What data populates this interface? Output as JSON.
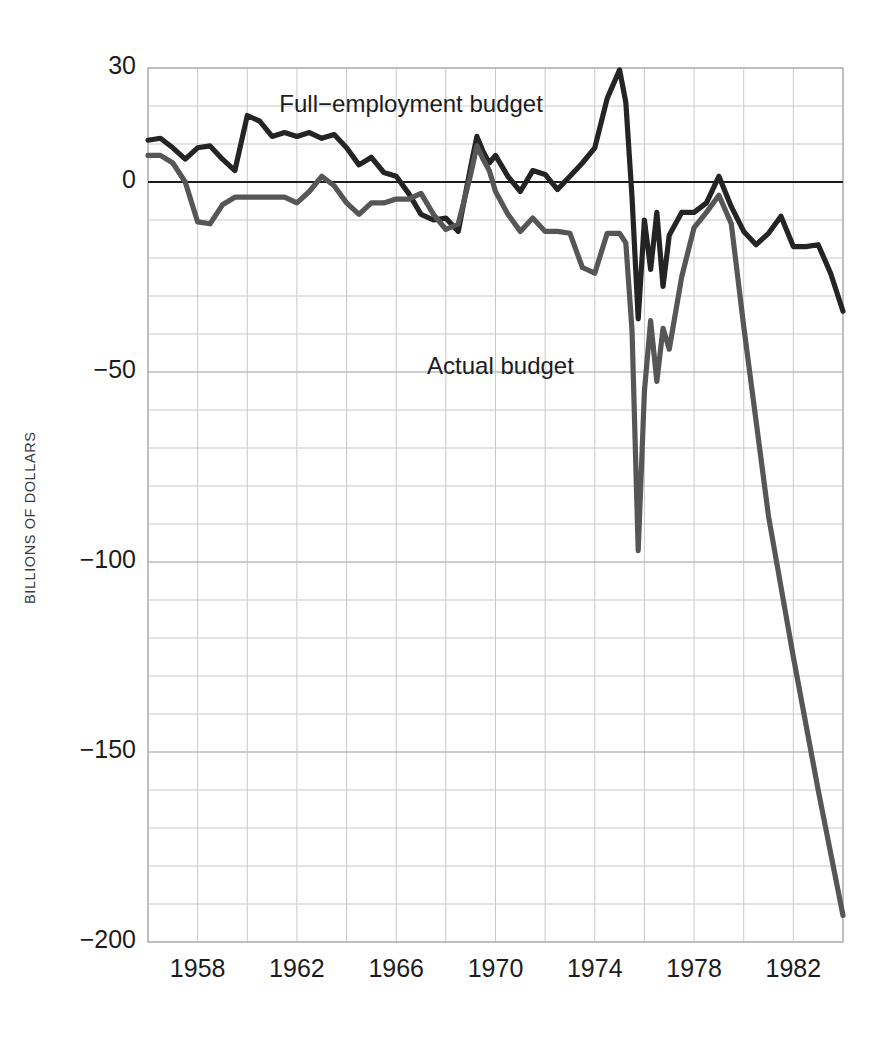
{
  "chart_data": {
    "type": "line",
    "title": "",
    "xlabel": "",
    "ylabel": "BILLIONS OF DOLLARS",
    "xlim": [
      1956.0,
      1984.0
    ],
    "ylim": [
      -200,
      30
    ],
    "grid": true,
    "grid_x_step": 2,
    "grid_y_step": 10,
    "legend_position": "inline-annotations",
    "xticks": [
      1958,
      1962,
      1966,
      1970,
      1974,
      1978,
      1982
    ],
    "yticks": [
      30,
      0,
      -50,
      -100,
      -150,
      -200
    ],
    "ytick_labels": [
      "30",
      "0",
      "−50",
      "−100",
      "−150",
      "−200"
    ],
    "annotations": [
      {
        "text": "Full−employment budget",
        "x": 1966.6,
        "y": 20.0
      },
      {
        "text": "Actual budget",
        "x": 1970.2,
        "y": -49.0
      }
    ],
    "series": [
      {
        "name": "Full−employment budget",
        "color": "#242424",
        "width": 5.2,
        "x": [
          1956.0,
          1956.5,
          1957.0,
          1957.5,
          1958.0,
          1958.5,
          1959.0,
          1959.5,
          1960.0,
          1960.5,
          1961.0,
          1961.5,
          1962.0,
          1962.5,
          1963.0,
          1963.5,
          1964.0,
          1964.5,
          1965.0,
          1965.5,
          1966.0,
          1966.5,
          1967.0,
          1967.5,
          1968.0,
          1968.5,
          1969.0,
          1969.25,
          1969.5,
          1969.75,
          1970.0,
          1970.5,
          1971.0,
          1971.5,
          1972.0,
          1972.5,
          1973.0,
          1973.5,
          1974.0,
          1974.5,
          1975.0,
          1975.25,
          1975.5,
          1975.75,
          1976.0,
          1976.25,
          1976.5,
          1976.75,
          1977.0,
          1977.5,
          1978.0,
          1978.5,
          1979.0,
          1979.5,
          1980.0,
          1980.5,
          1981.0,
          1981.5,
          1982.0,
          1982.5,
          1983.0,
          1983.5,
          1984.0
        ],
        "y": [
          11.0,
          11.5,
          9.0,
          6.0,
          9.0,
          9.5,
          6.0,
          3.0,
          17.5,
          16.0,
          12.0,
          13.0,
          12.0,
          13.0,
          11.5,
          12.5,
          9.0,
          4.5,
          6.5,
          2.5,
          1.5,
          -3.0,
          -8.5,
          -10.0,
          -9.5,
          -13.0,
          4.0,
          12.0,
          8.0,
          5.0,
          7.0,
          1.5,
          -2.5,
          3.0,
          2.0,
          -2.0,
          1.5,
          5.0,
          9.0,
          22.0,
          29.5,
          21.0,
          -4.0,
          -36.0,
          -10.0,
          -23.0,
          -8.0,
          -27.5,
          -14.0,
          -8.0,
          -8.0,
          -5.5,
          1.5,
          -6.5,
          -13.0,
          -16.5,
          -13.5,
          -9.0,
          -17.0,
          -17.0,
          -16.5,
          -24.0,
          -34.0
        ]
      },
      {
        "name": "Actual budget",
        "color": "#565656",
        "width": 5.2,
        "x": [
          1956.0,
          1956.5,
          1957.0,
          1957.5,
          1958.0,
          1958.5,
          1959.0,
          1959.5,
          1960.0,
          1960.5,
          1961.0,
          1961.5,
          1962.0,
          1962.5,
          1963.0,
          1963.5,
          1964.0,
          1964.5,
          1965.0,
          1965.5,
          1966.0,
          1966.5,
          1967.0,
          1967.5,
          1968.0,
          1968.5,
          1969.0,
          1969.25,
          1969.5,
          1969.75,
          1970.0,
          1970.5,
          1971.0,
          1971.5,
          1972.0,
          1972.5,
          1973.0,
          1973.5,
          1974.0,
          1974.5,
          1975.0,
          1975.25,
          1975.5,
          1975.75,
          1976.0,
          1976.25,
          1976.5,
          1976.75,
          1977.0,
          1977.5,
          1978.0,
          1978.5,
          1979.0,
          1979.5,
          1980.0,
          1980.5,
          1981.0,
          1982.0,
          1983.0,
          1984.0
        ],
        "y": [
          7.0,
          7.0,
          5.0,
          0.0,
          -10.5,
          -11.0,
          -6.0,
          -4.0,
          -4.0,
          -4.0,
          -4.0,
          -4.0,
          -5.5,
          -2.5,
          1.5,
          -1.0,
          -5.5,
          -8.5,
          -5.5,
          -5.5,
          -4.5,
          -4.5,
          -3.0,
          -8.5,
          -12.5,
          -11.0,
          2.0,
          9.5,
          6.0,
          3.0,
          -2.5,
          -8.5,
          -13.0,
          -9.5,
          -13.0,
          -13.0,
          -13.5,
          -22.5,
          -24.0,
          -13.5,
          -13.5,
          -16.0,
          -39.0,
          -97.0,
          -55.0,
          -36.5,
          -52.5,
          -38.5,
          -44.0,
          -25.0,
          -12.0,
          -8.0,
          -3.5,
          -11.0,
          -38.0,
          -63.0,
          -88.0,
          -125.0,
          -160.0,
          -193.0
        ]
      }
    ]
  },
  "axis": {
    "y_label": "BILLIONS OF DOLLARS"
  }
}
